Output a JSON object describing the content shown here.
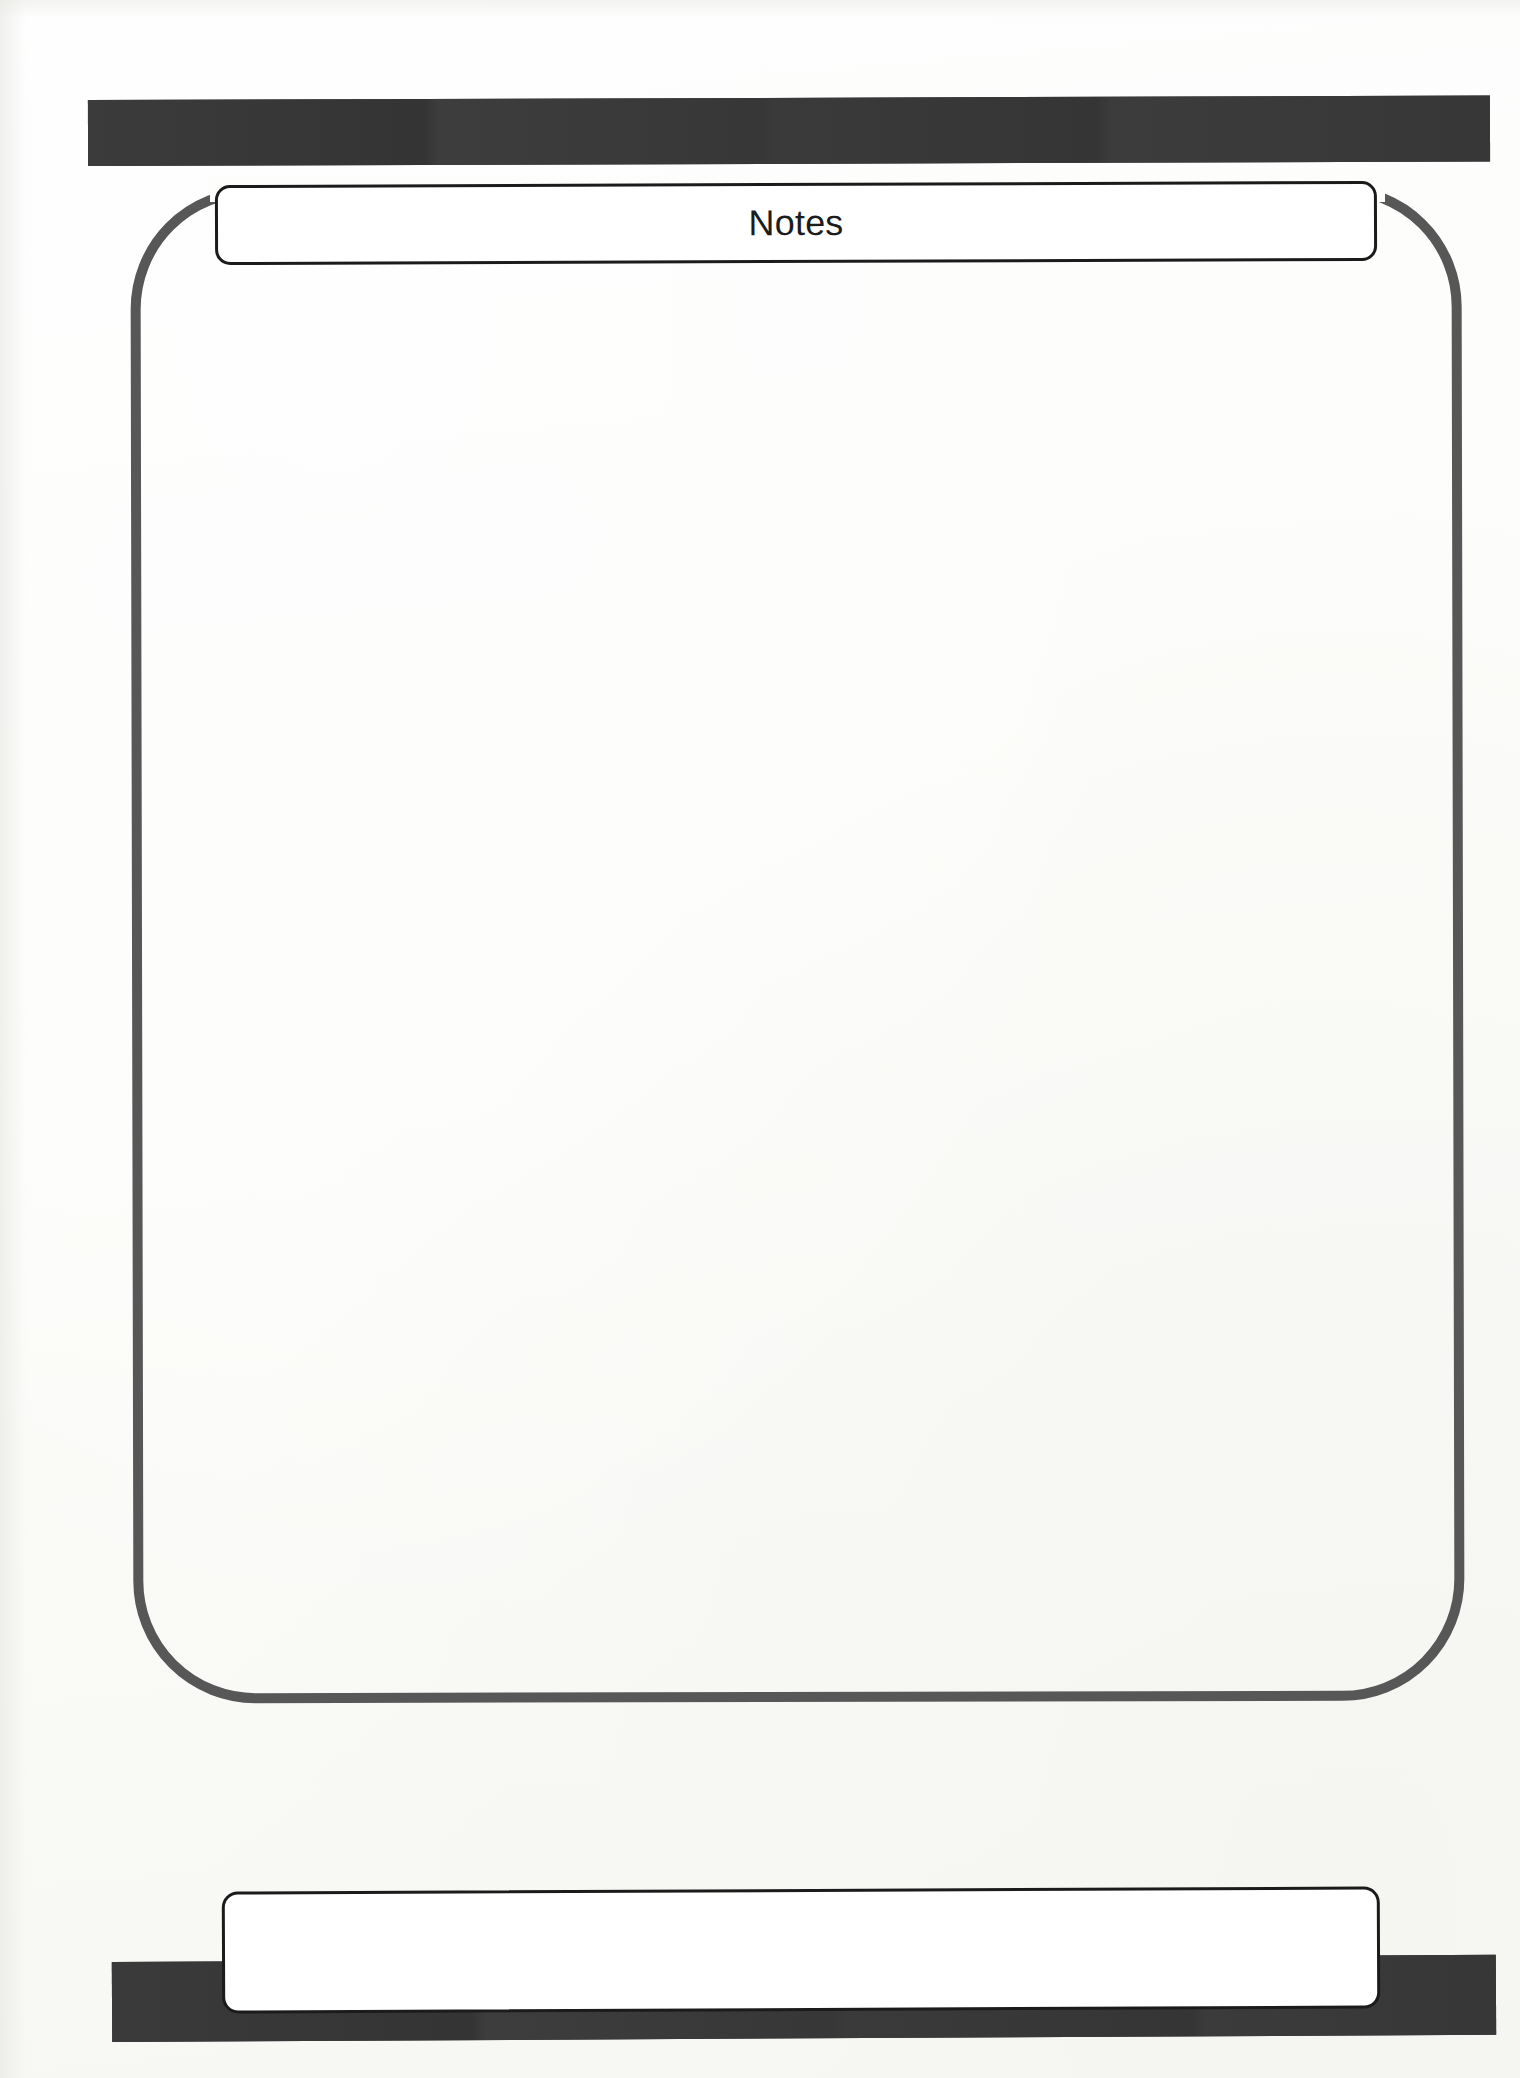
{
  "page": {
    "title": "Notes",
    "background_color": "#fdfdfb",
    "width": 1520,
    "height": 2078
  },
  "header": {
    "rule_color": "#383838",
    "rule_label": ""
  },
  "title_plate": {
    "label": "Notes",
    "border_color": "#1b1b1b",
    "fill_color": "#ffffff"
  },
  "note_frame": {
    "border_color": "#575757",
    "corner_radius": "122px"
  },
  "note_body": {
    "content": "",
    "placeholder": ""
  },
  "footer": {
    "plate_label": "",
    "plate_border_color": "#1b1b1b",
    "plate_fill_color": "#ffffff",
    "rule_color": "#383838"
  }
}
